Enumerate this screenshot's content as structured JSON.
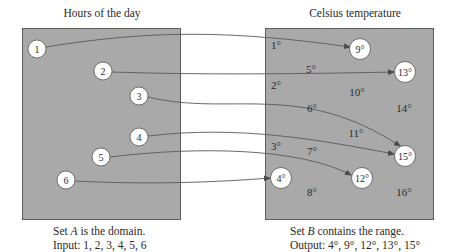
{
  "left_set": {
    "title": "Hours of the day",
    "caption_line1_prefix": "Set ",
    "caption_line1_var": "A",
    "caption_line1_suffix": " is the domain.",
    "caption_line2": "Input: 1, 2, 3, 4, 5, 6",
    "elements": [
      {
        "label": "1",
        "cx": 37,
        "cy": 49
      },
      {
        "label": "2",
        "cx": 103,
        "cy": 71
      },
      {
        "label": "3",
        "cx": 139,
        "cy": 96
      },
      {
        "label": "4",
        "cx": 139,
        "cy": 137
      },
      {
        "label": "5",
        "cx": 101,
        "cy": 157
      },
      {
        "label": "6",
        "cx": 66,
        "cy": 180
      }
    ]
  },
  "right_set": {
    "title": "Celsius temperature",
    "caption_line1_prefix": "Set ",
    "caption_line1_var": "B",
    "caption_line1_suffix": " contains the range.",
    "caption_line2": "Output: 4°, 9°, 12°, 13°, 15°",
    "circled": [
      {
        "label": "9°",
        "cx": 360,
        "cy": 49
      },
      {
        "label": "13°",
        "cx": 405,
        "cy": 72
      },
      {
        "label": "15°",
        "cx": 405,
        "cy": 156
      },
      {
        "label": "12°",
        "cx": 362,
        "cy": 178
      },
      {
        "label": "4°",
        "cx": 281,
        "cy": 178
      }
    ],
    "uncircled": [
      {
        "label": "1°",
        "x": 276,
        "y": 49
      },
      {
        "label": "5°",
        "x": 311,
        "y": 73
      },
      {
        "label": "2°",
        "x": 276,
        "y": 89
      },
      {
        "label": "10°",
        "x": 357,
        "y": 96
      },
      {
        "label": "6°",
        "x": 312,
        "y": 112
      },
      {
        "label": "14°",
        "x": 404,
        "y": 112
      },
      {
        "label": "11°",
        "x": 356,
        "y": 137
      },
      {
        "label": "3°",
        "x": 276,
        "y": 150
      },
      {
        "label": "7°",
        "x": 312,
        "y": 155
      },
      {
        "label": "8°",
        "x": 312,
        "y": 196
      },
      {
        "label": "16°",
        "x": 404,
        "y": 196
      }
    ]
  },
  "mappings": [
    {
      "from": "1",
      "to": "9°"
    },
    {
      "from": "2",
      "to": "13°"
    },
    {
      "from": "3",
      "to": "15°"
    },
    {
      "from": "4",
      "to": "15°"
    },
    {
      "from": "5",
      "to": "12°"
    },
    {
      "from": "6",
      "to": "4°"
    }
  ],
  "colors": {
    "box_fill": "#a9a9a9",
    "box_border": "#5e5e5e",
    "circle_fill": "#ffffff",
    "arrow": "#4a4a4a"
  }
}
